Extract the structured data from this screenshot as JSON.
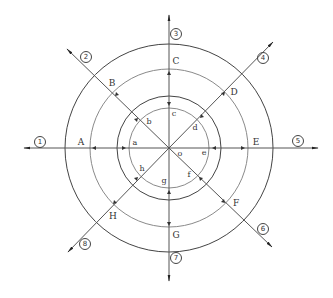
{
  "diagram": {
    "center": {
      "x": 169,
      "y": 148
    },
    "circles": [
      {
        "name": "outer",
        "r": 104,
        "color": "#444444"
      },
      {
        "name": "second",
        "r": 79,
        "color": "#8a8a8a"
      },
      {
        "name": "third",
        "r": 52,
        "color": "#444444"
      },
      {
        "name": "inner",
        "r": 40,
        "color": "#8a8a8a"
      }
    ],
    "axis_color": "#555555",
    "center_label": "o",
    "directions": [
      {
        "id": "1",
        "symbol": "①",
        "upper": "A",
        "lower": "a"
      },
      {
        "id": "2",
        "symbol": "②",
        "upper": "B",
        "lower": "b"
      },
      {
        "id": "3",
        "symbol": "③",
        "upper": "C",
        "lower": "c"
      },
      {
        "id": "4",
        "symbol": "④",
        "upper": "D",
        "lower": "d"
      },
      {
        "id": "5",
        "symbol": "⑤",
        "upper": "E",
        "lower": "e"
      },
      {
        "id": "6",
        "symbol": "⑥",
        "upper": "F",
        "lower": "f"
      },
      {
        "id": "7",
        "symbol": "⑦",
        "upper": "G",
        "lower": "g"
      },
      {
        "id": "8",
        "symbol": "⑧",
        "upper": "H",
        "lower": "h"
      }
    ]
  }
}
